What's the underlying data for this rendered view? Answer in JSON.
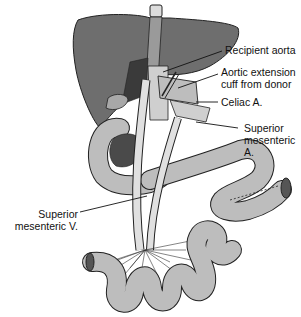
{
  "diagram": {
    "colors": {
      "liver": "#6e6e6e",
      "bowel": "#bdbdbd",
      "vessel": "#e0e0e0",
      "outline": "#222222",
      "pancreas_dark": "#4a4a4a"
    },
    "labels": [
      {
        "id": "recipient-aorta",
        "line1": "Recipient aorta",
        "line2": ""
      },
      {
        "id": "aortic-extension-cuff",
        "line1": "Aortic extension",
        "line2": "cuff from donor"
      },
      {
        "id": "celiac-a",
        "line1": "Celiac A.",
        "line2": ""
      },
      {
        "id": "superior-mesenteric-a",
        "line1": "Superior",
        "line2": "mesenteric",
        "line3": "A."
      },
      {
        "id": "superior-mesenteric-v",
        "line1": "Superior",
        "line2": "mesenteric V."
      }
    ]
  }
}
